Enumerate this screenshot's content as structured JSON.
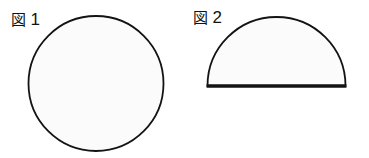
{
  "page": {
    "background_color": "#ffffff",
    "width": 369,
    "height": 158,
    "content_type": "geometry-figure-pair"
  },
  "figures": [
    {
      "label_word": "図",
      "label_number": "1",
      "label_full": "図 1",
      "shape": "circle",
      "shape_name": "circle-outline",
      "stroke_color": "#131313",
      "fill_color": "#fbfbfb",
      "stroke_width": 1.8,
      "geometry": {
        "center_x": 96,
        "center_y": 83.5,
        "radius": 67.5,
        "diameter": 135
      }
    },
    {
      "label_word": "図",
      "label_number": "2",
      "label_full": "図 2",
      "shape": "semicircle",
      "shape_name": "semicircle-outline",
      "stroke_color": "#131313",
      "fill_color": "#fbfbfb",
      "stroke_width": 1.8,
      "baseline_stroke_width": 3.4,
      "geometry": {
        "center_x": 91.5,
        "baseline_y": 86,
        "radius": 69,
        "diameter": 138,
        "flat_side": "bottom"
      }
    }
  ]
}
